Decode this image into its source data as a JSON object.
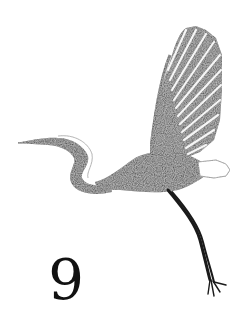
{
  "illustration": {
    "subject": "heron-in-flight",
    "style": "pencil-sketch",
    "ink_color": "#1a1a1a",
    "background_color": "#ffffff"
  },
  "caption": {
    "numeral": "9"
  }
}
